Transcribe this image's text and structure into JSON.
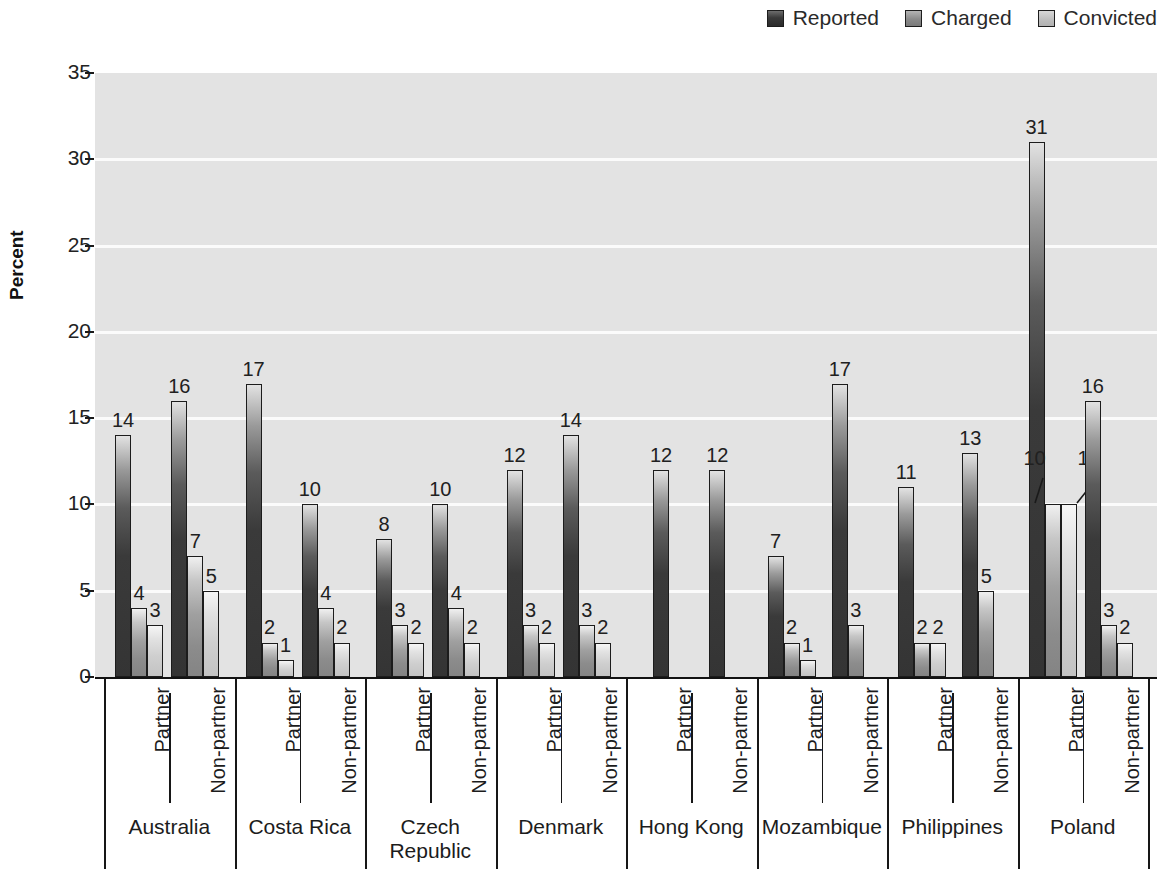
{
  "legend": {
    "position": "top-right",
    "items": [
      {
        "label": "Reported",
        "icon": "square-swatch-dark",
        "color": "#3a3a3a"
      },
      {
        "label": "Charged",
        "icon": "square-swatch-medium",
        "color": "#8a8a8a"
      },
      {
        "label": "Convicted",
        "icon": "square-swatch-light",
        "color": "#c3c3c3"
      }
    ]
  },
  "axes": {
    "ylabel": "Percent",
    "yticks": [
      "0",
      "5",
      "10",
      "15",
      "20",
      "25",
      "30",
      "35"
    ],
    "ylim": [
      0,
      35
    ],
    "grid": true
  },
  "chart_data": {
    "type": "bar",
    "title": "",
    "xlabel": "",
    "ylabel": "Percent",
    "ylim": [
      0,
      35
    ],
    "grid": true,
    "legend_position": "top-right",
    "series": [
      {
        "name": "Reported",
        "values": [
          14,
          16,
          17,
          10,
          8,
          10,
          12,
          14,
          12,
          12,
          7,
          17,
          11,
          13,
          31,
          16
        ]
      },
      {
        "name": "Charged",
        "values": [
          4,
          7,
          2,
          4,
          3,
          4,
          3,
          3,
          null,
          null,
          2,
          3,
          2,
          5,
          10,
          3
        ]
      },
      {
        "name": "Convicted",
        "values": [
          3,
          5,
          1,
          2,
          2,
          2,
          2,
          2,
          null,
          null,
          1,
          null,
          2,
          null,
          10,
          2
        ]
      }
    ],
    "categories": [
      "Australia / Partner",
      "Australia / Non-partner",
      "Costa Rica / Partner",
      "Costa Rica / Non-partner",
      "Czech Republic / Partner",
      "Czech Republic / Non-partner",
      "Denmark / Partner",
      "Denmark / Non-partner",
      "Hong Kong / Partner",
      "Hong Kong / Non-partner",
      "Mozambique / Partner",
      "Mozambique / Non-partner",
      "Philippines / Partner",
      "Philippines / Non-partner",
      "Poland / Partner",
      "Poland / Non-partner"
    ],
    "groups": [
      {
        "country": "Australia",
        "subgroups": [
          {
            "label": "Partner",
            "Reported": 14,
            "Charged": 4,
            "Convicted": 3
          },
          {
            "label": "Non-partner",
            "Reported": 16,
            "Charged": 7,
            "Convicted": 5
          }
        ]
      },
      {
        "country": "Costa Rica",
        "subgroups": [
          {
            "label": "Partner",
            "Reported": 17,
            "Charged": 2,
            "Convicted": 1
          },
          {
            "label": "Non-partner",
            "Reported": 10,
            "Charged": 4,
            "Convicted": 2
          }
        ]
      },
      {
        "country": "Czech\nRepublic",
        "subgroups": [
          {
            "label": "Partner",
            "Reported": 8,
            "Charged": 3,
            "Convicted": 2
          },
          {
            "label": "Non-partner",
            "Reported": 10,
            "Charged": 4,
            "Convicted": 2
          }
        ]
      },
      {
        "country": "Denmark",
        "subgroups": [
          {
            "label": "Partner",
            "Reported": 12,
            "Charged": 3,
            "Convicted": 2
          },
          {
            "label": "Non-partner",
            "Reported": 14,
            "Charged": 3,
            "Convicted": 2
          }
        ]
      },
      {
        "country": "Hong Kong",
        "subgroups": [
          {
            "label": "Partner",
            "Reported": 12,
            "Charged": null,
            "Convicted": null
          },
          {
            "label": "Non-partner",
            "Reported": 12,
            "Charged": null,
            "Convicted": null
          }
        ]
      },
      {
        "country": "Mozambique",
        "subgroups": [
          {
            "label": "Partner",
            "Reported": 7,
            "Charged": 2,
            "Convicted": 1
          },
          {
            "label": "Non-partner",
            "Reported": 17,
            "Charged": 3,
            "Convicted": null
          }
        ]
      },
      {
        "country": "Philippines",
        "subgroups": [
          {
            "label": "Partner",
            "Reported": 11,
            "Charged": 2,
            "Convicted": 2
          },
          {
            "label": "Non-partner",
            "Reported": 13,
            "Charged": 5,
            "Convicted": null
          }
        ]
      },
      {
        "country": "Poland",
        "subgroups": [
          {
            "label": "Partner",
            "Reported": 31,
            "Charged": 10,
            "Convicted": 10,
            "label_style": "leader-line"
          },
          {
            "label": "Non-partner",
            "Reported": 16,
            "Charged": 3,
            "Convicted": 2
          }
        ]
      }
    ]
  },
  "colors": {
    "plot_background": "#e3e3e3",
    "gridline": "#fbfbfb",
    "axis": "#121212",
    "reported": "#3a3a3a",
    "charged": "#8a8a8a",
    "convicted": "#c3c3c3"
  }
}
